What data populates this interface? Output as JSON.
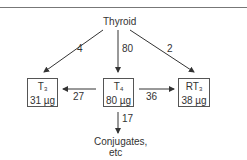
{
  "source": {
    "label": "Thyroid"
  },
  "nodes": [
    {
      "id": "t3",
      "name": "T",
      "sub": "3",
      "amount": "31 µg"
    },
    {
      "id": "t4",
      "name": "T",
      "sub": "4",
      "amount": "80 µg"
    },
    {
      "id": "rt3",
      "name": "RT",
      "sub": "3",
      "amount": "38 µg"
    }
  ],
  "sink": {
    "line1": "Conjugates,",
    "line2": "etc"
  },
  "edges": [
    {
      "from": "Thyroid",
      "to": "T3",
      "value": "4"
    },
    {
      "from": "Thyroid",
      "to": "T4",
      "value": "80"
    },
    {
      "from": "Thyroid",
      "to": "RT3",
      "value": "2"
    },
    {
      "from": "T4",
      "to": "T3",
      "value": "27"
    },
    {
      "from": "T4",
      "to": "RT3",
      "value": "36"
    },
    {
      "from": "T4",
      "to": "Conjugates",
      "value": "17"
    }
  ]
}
